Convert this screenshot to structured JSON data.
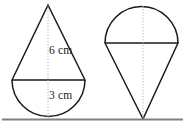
{
  "figure": {
    "background_color": "#ffffff",
    "stroke_color": "#1a1a1a",
    "axis_color": "#b4b4b4",
    "ground_color": "#808080",
    "labels": {
      "height": "6 cm",
      "radius": "3 cm"
    },
    "left_shape": {
      "name": "cone-up-over-hemisphere-down",
      "apex": {
        "x": 48,
        "y": 5
      },
      "diameter_line": {
        "x1": 12,
        "x2": 85,
        "y": 80
      },
      "hemisphere_bottom_y": 119,
      "cone_height_cm": 6,
      "hemisphere_radius_cm": 3,
      "center_axis_x": 48
    },
    "right_shape": {
      "name": "hemisphere-up-over-cone-down",
      "apex": {
        "x": 143,
        "y": 119
      },
      "diameter_line": {
        "x1": 105,
        "x2": 178,
        "y": 43
      },
      "hemisphere_top_y": 5,
      "center_axis_x": 143
    },
    "ground_line": {
      "x1": 2,
      "x2": 183,
      "y": 119.5
    }
  }
}
